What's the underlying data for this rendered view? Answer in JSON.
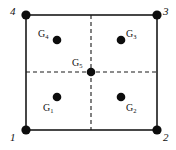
{
  "figure": {
    "width": 176,
    "height": 150,
    "background_color": "#ffffff",
    "line_color": "#1a1a1a",
    "dash_color": "#1a1a1a",
    "node_color": "#0d0d0d",
    "gauss_point_color": "#0d0d0d"
  },
  "element_boundary": {
    "x_left": 26,
    "x_right": 157,
    "y_top": 15,
    "y_bottom": 130,
    "stroke_width": 1.6
  },
  "crosshair": {
    "vertical_x": 91,
    "horizontal_y": 72,
    "dash_pattern": "4 3",
    "stroke_width": 1.1
  },
  "corner_nodes": [
    {
      "id": "node-1",
      "label": "1",
      "cx": 26,
      "cy": 130,
      "r": 4.6,
      "label_x": 10,
      "label_y": 132
    },
    {
      "id": "node-2",
      "label": "2",
      "cx": 157,
      "cy": 130,
      "r": 4.6,
      "label_x": 163,
      "label_y": 132
    },
    {
      "id": "node-3",
      "label": "3",
      "cx": 157,
      "cy": 15,
      "r": 4.6,
      "label_x": 163,
      "label_y": 6
    },
    {
      "id": "node-4",
      "label": "4",
      "cx": 26,
      "cy": 15,
      "r": 4.6,
      "label_x": 10,
      "label_y": 6
    }
  ],
  "gauss_points": [
    {
      "id": "gauss-point-1",
      "base": "G",
      "subscript": "1",
      "cx": 57,
      "cy": 97,
      "r": 4.3,
      "label_x": 43,
      "label_y": 103
    },
    {
      "id": "gauss-point-2",
      "base": "G",
      "subscript": "2",
      "cx": 121,
      "cy": 97,
      "r": 4.3,
      "label_x": 126,
      "label_y": 103
    },
    {
      "id": "gauss-point-3",
      "base": "G",
      "subscript": "3",
      "cx": 121,
      "cy": 40,
      "r": 4.3,
      "label_x": 126,
      "label_y": 29
    },
    {
      "id": "gauss-point-4",
      "base": "G",
      "subscript": "4",
      "cx": 57,
      "cy": 40,
      "r": 4.3,
      "label_x": 38,
      "label_y": 29
    },
    {
      "id": "gauss-point-5",
      "base": "G",
      "subscript": "5",
      "cx": 91,
      "cy": 72,
      "r": 4.3,
      "label_x": 72,
      "label_y": 58
    }
  ]
}
